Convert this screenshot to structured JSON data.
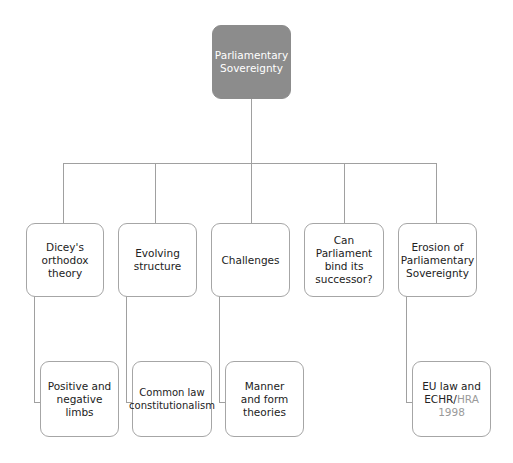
{
  "root": {
    "label_line1": "Parliamentary",
    "label_line2": "Sovereignty",
    "fill": "#8c8c8c"
  },
  "branches": [
    {
      "label": "Dicey's orthodox theory",
      "child": "Positive and negative limbs"
    },
    {
      "label": "Evolving structure",
      "child": "Common law constitutionalism"
    },
    {
      "label": "Challenges",
      "child": "Manner and form theories"
    },
    {
      "label": "Can Parliament bind its successor?",
      "child": null
    },
    {
      "label": "Erosion of Parliamentary Sovereignty",
      "child_part1": "EU law and ECHR/",
      "child_part2": "HRA 1998"
    }
  ],
  "colors": {
    "line": "#a0a0a0",
    "border": "#a6a6a6",
    "muted_text": "#9a9a9a"
  }
}
